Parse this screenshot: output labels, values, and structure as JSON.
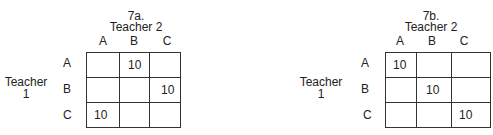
{
  "tables": [
    {
      "title": "7a.",
      "col_header": "Teacher 2",
      "row_header_line1": "Teacher",
      "row_header_line2": "1",
      "columns": [
        "A",
        "B",
        "C"
      ],
      "rows": [
        "A",
        "B",
        "C"
      ],
      "cells": [
        [
          "",
          "10",
          ""
        ],
        [
          "",
          "",
          "10"
        ],
        [
          "10",
          "",
          ""
        ]
      ]
    },
    {
      "title": "7b.",
      "col_header": "Teacher 2",
      "row_header_line1": "Teacher",
      "row_header_line2": "1",
      "columns": [
        "A",
        "B",
        "C"
      ],
      "rows": [
        "A",
        "B",
        "C"
      ],
      "cells": [
        [
          "10",
          "",
          ""
        ],
        [
          "",
          "10",
          ""
        ],
        [
          "",
          "",
          "10"
        ]
      ]
    }
  ]
}
